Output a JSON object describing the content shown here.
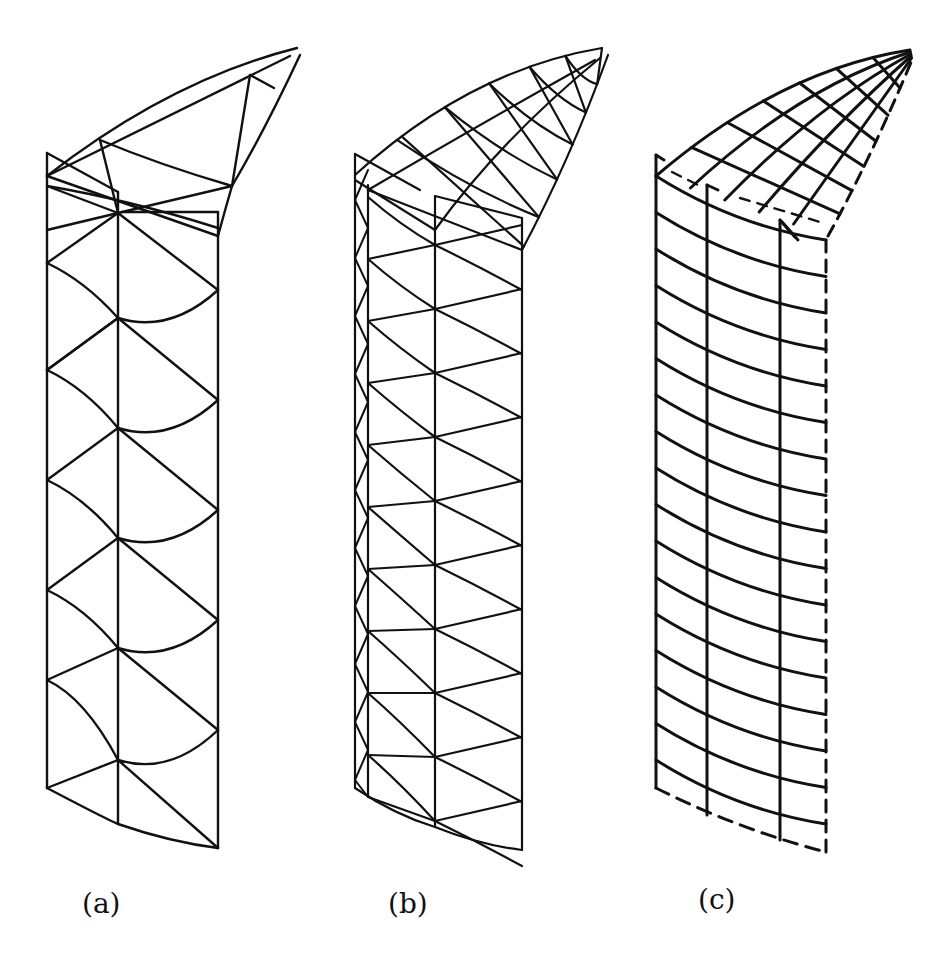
{
  "figure": {
    "stroke_color": "#111111",
    "background": "#ffffff",
    "panels": [
      {
        "id": "a",
        "label": "(a)",
        "label_pos": [
          82,
          890
        ],
        "description": "Coarse triangular shell mesh",
        "stroke_width": 2.4,
        "columns_x": [
          47,
          118,
          218
        ],
        "rows_y_left": [
          175,
          263,
          370,
          480,
          590,
          680,
          788
        ],
        "rows_y_mid": [
          213,
          318,
          428,
          538,
          648,
          760,
          824
        ],
        "rows_y_right": [
          236,
          290,
          400,
          510,
          620,
          730,
          848
        ],
        "top_tip": [
          297,
          48
        ]
      },
      {
        "id": "b",
        "label": "(b)",
        "label_pos": [
          388,
          890
        ],
        "description": "Refined triangular shell mesh",
        "stroke_width": 2.2,
        "columns_x": [
          355,
          368,
          435,
          522
        ],
        "top_tip": [
          602,
          48
        ]
      },
      {
        "id": "c",
        "label": "(c)",
        "label_pos": [
          698,
          886
        ],
        "description": "Quadrilateral shell mesh with dashed symmetry edges",
        "stroke_width": 3.0,
        "columns_x": [
          656,
          707,
          780,
          826
        ],
        "top_tip": [
          910,
          50
        ]
      }
    ]
  }
}
